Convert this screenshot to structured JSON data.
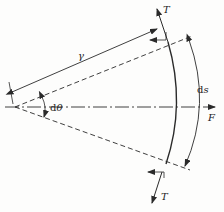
{
  "diagram": {
    "labels": {
      "radius": "γ",
      "angle_d": "d",
      "angle_theta": "θ",
      "arc_d": "d",
      "arc_s": "s",
      "force": "F",
      "tension_top": "T",
      "tension_bottom": "T"
    },
    "colors": {
      "line": "#2a2a2a",
      "background": "#fdfdfc"
    }
  }
}
